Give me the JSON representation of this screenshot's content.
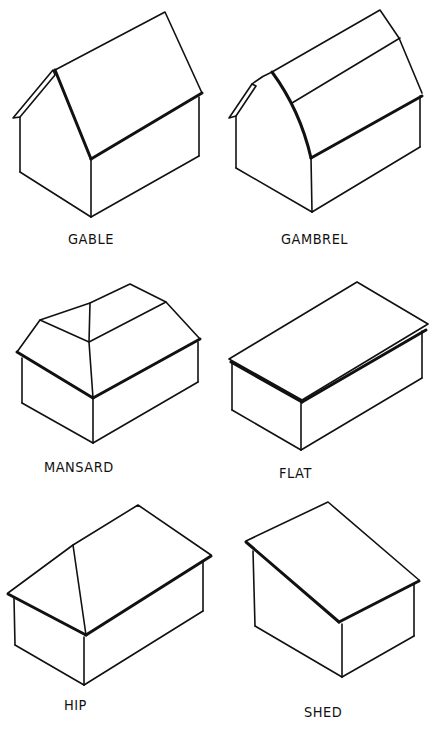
{
  "diagram": {
    "stroke_color": "#111111",
    "background": "#ffffff",
    "items": [
      {
        "label": "GABLE"
      },
      {
        "label": "GAMBREL"
      },
      {
        "label": "MANSARD"
      },
      {
        "label": "FLAT"
      },
      {
        "label": "HIP"
      },
      {
        "label": "SHED"
      }
    ]
  }
}
